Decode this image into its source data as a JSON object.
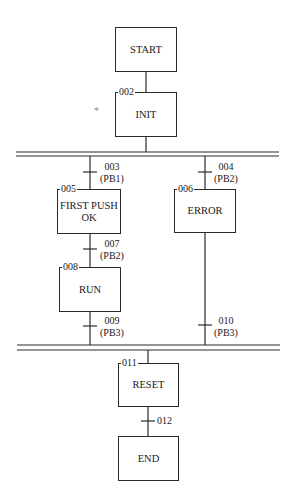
{
  "diagram": {
    "type": "SFC / Grafcet",
    "steps": [
      {
        "id": "start",
        "label": "START",
        "number": ""
      },
      {
        "id": "init",
        "label": "INIT",
        "number": "002"
      },
      {
        "id": "first_push",
        "label": "FIRST PUSH\nOK",
        "line1": "FIRST PUSH",
        "line2": "OK",
        "number": "005"
      },
      {
        "id": "error",
        "label": "ERROR",
        "number": "006"
      },
      {
        "id": "run",
        "label": "RUN",
        "number": "008"
      },
      {
        "id": "reset",
        "label": "RESET",
        "number": "011"
      },
      {
        "id": "end",
        "label": "END",
        "number": ""
      }
    ],
    "transitions": [
      {
        "number": "003",
        "condition": "(PB1)"
      },
      {
        "number": "004",
        "condition": "(PB2)"
      },
      {
        "number": "007",
        "condition": "(PB2)"
      },
      {
        "number": "009",
        "condition": "(PB3)"
      },
      {
        "number": "010",
        "condition": "(PB3)"
      },
      {
        "number": "012",
        "condition": ""
      }
    ],
    "marker": "*"
  }
}
